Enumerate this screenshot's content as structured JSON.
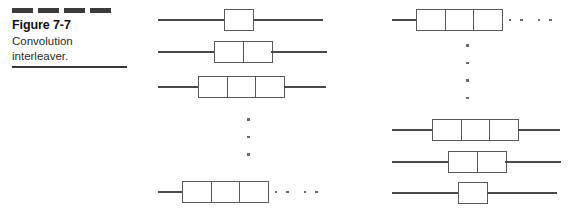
{
  "caption": {
    "dash_count": 4,
    "dash_color": "#3b3b3b",
    "figure_number": "Figure 7-7",
    "caption_line_1": "Convolution",
    "caption_line_2": "interleaver."
  },
  "diagram": {
    "line_color": "#4a4a4a",
    "box_border_color": "#5a5a5a",
    "dot_color": "#6a6a6a",
    "left_column": {
      "label": "interleaver-branches",
      "rows": [
        {
          "cells": 1,
          "lead": 66,
          "tail": 70,
          "trailing_dots": 0
        },
        {
          "cells": 2,
          "lead": 56,
          "tail": 56,
          "trailing_dots": 0
        },
        {
          "cells": 3,
          "lead": 40,
          "tail": 42,
          "trailing_dots": 0
        },
        {
          "cells": 3,
          "lead": 24,
          "tail": 0,
          "trailing_dots": 4
        }
      ],
      "vertical_dots": 3
    },
    "right_column": {
      "label": "deinterleaver-branches",
      "rows": [
        {
          "cells": 3,
          "lead": 24,
          "tail": 0,
          "trailing_dots": 4
        },
        {
          "cells": 3,
          "lead": 40,
          "tail": 42,
          "trailing_dots": 0
        },
        {
          "cells": 2,
          "lead": 56,
          "tail": 56,
          "trailing_dots": 0
        },
        {
          "cells": 1,
          "lead": 66,
          "tail": 70,
          "trailing_dots": 0
        }
      ],
      "vertical_dots": 4
    }
  }
}
